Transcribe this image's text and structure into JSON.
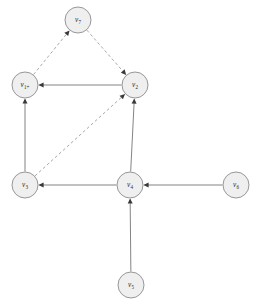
{
  "diagram": {
    "type": "directed-graph",
    "width": 257,
    "height": 306,
    "background_color": "#ffffff",
    "node_fill_color": "#efefef",
    "node_stroke_color": "#8c8c8c",
    "solid_edge_color": "#6e6e6e",
    "dashed_edge_color": "#9a9a9a",
    "arrow_color": "#3a3a3a",
    "node_radius": 13
  },
  "nodes": [
    {
      "id": "v7",
      "label": "v",
      "subscript": "7",
      "cx": 78,
      "cy": 20
    },
    {
      "id": "v1p",
      "label": "v",
      "subscript": "1+",
      "cx": 25,
      "cy": 85
    },
    {
      "id": "v2",
      "label": "v",
      "subscript": "2",
      "cx": 135,
      "cy": 85
    },
    {
      "id": "v3",
      "label": "v",
      "subscript": "3",
      "cx": 25,
      "cy": 185
    },
    {
      "id": "v4",
      "label": "v",
      "subscript": "4",
      "cx": 130,
      "cy": 185
    },
    {
      "id": "v6",
      "label": "v",
      "subscript": "6",
      "cx": 236,
      "cy": 185
    },
    {
      "id": "v5",
      "label": "v",
      "subscript": "5",
      "cx": 131,
      "cy": 285
    }
  ],
  "edges": [
    {
      "id": "e-v1p-v7",
      "from": "v1p",
      "to": "v7",
      "style": "dashed",
      "directed": true
    },
    {
      "id": "e-v7-v2",
      "from": "v7",
      "to": "v2",
      "style": "dashed",
      "directed": true
    },
    {
      "id": "e-v3-v2",
      "from": "v3",
      "to": "v2",
      "style": "dashed",
      "directed": true
    },
    {
      "id": "e-v2-v1p",
      "from": "v2",
      "to": "v1p",
      "style": "solid",
      "directed": true
    },
    {
      "id": "e-v3-v1p",
      "from": "v3",
      "to": "v1p",
      "style": "solid",
      "directed": true
    },
    {
      "id": "e-v4-v2",
      "from": "v4",
      "to": "v2",
      "style": "solid",
      "directed": true
    },
    {
      "id": "e-v4-v3",
      "from": "v4",
      "to": "v3",
      "style": "solid",
      "directed": true
    },
    {
      "id": "e-v6-v4",
      "from": "v6",
      "to": "v4",
      "style": "solid",
      "directed": true
    },
    {
      "id": "e-v5-v4",
      "from": "v5",
      "to": "v4",
      "style": "solid",
      "directed": true
    }
  ]
}
